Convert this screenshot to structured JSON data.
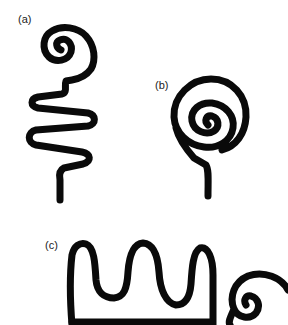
{
  "figure": {
    "panels": [
      {
        "id": "a",
        "label": "(a)",
        "description": "spiral with meandering zigzag tail"
      },
      {
        "id": "b",
        "label": "(b)",
        "description": "spiral with short straight tail"
      },
      {
        "id": "c",
        "label": "(c)",
        "description": "meander of three loops ending in spiral"
      }
    ],
    "colors": {
      "ink": "#0a0a0a",
      "background": "#ffffff"
    }
  }
}
